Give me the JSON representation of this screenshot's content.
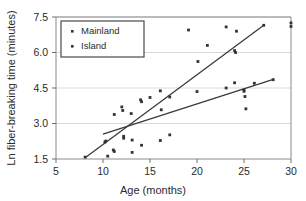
{
  "chart_data": {
    "type": "scatter",
    "title": "",
    "xlabel": "Age (months)",
    "ylabel": "Ln fiber-breaking time (minutes)",
    "xlim": [
      5,
      30
    ],
    "ylim": [
      1.5,
      7.5
    ],
    "xticks": [
      5,
      10,
      15,
      20,
      25,
      30
    ],
    "yticks": [
      1.5,
      3.0,
      4.5,
      6.0,
      7.5
    ],
    "xtick_labels": [
      "5",
      "10",
      "15",
      "20",
      "25",
      "30"
    ],
    "ytick_labels": [
      "1.5",
      "3.0",
      "4.5",
      "6.0",
      "7.5"
    ],
    "grid": "horizontal",
    "legend_position": "top-left",
    "marker_color": "#333333",
    "line_color": "#3a3a3a",
    "series": [
      {
        "name": "Mainland",
        "marker": "square-dot",
        "points": [
          [
            8.1,
            1.58
          ],
          [
            10.2,
            2.22
          ],
          [
            10.3,
            2.26
          ],
          [
            11.2,
            3.38
          ],
          [
            12.0,
            3.7
          ],
          [
            12.1,
            3.55
          ],
          [
            12.2,
            2.46
          ],
          [
            12.2,
            2.38
          ],
          [
            13.0,
            3.42
          ],
          [
            13.1,
            2.3
          ],
          [
            14.0,
            4.0
          ],
          [
            14.1,
            3.92
          ],
          [
            15.0,
            4.1
          ],
          [
            16.1,
            4.38
          ],
          [
            16.2,
            3.58
          ],
          [
            17.1,
            4.12
          ],
          [
            19.1,
            6.95
          ],
          [
            20.0,
            4.35
          ],
          [
            20.1,
            5.62
          ],
          [
            21.1,
            6.3
          ],
          [
            23.1,
            7.08
          ],
          [
            24.0,
            6.08
          ],
          [
            24.1,
            6.0
          ],
          [
            24.2,
            6.9
          ],
          [
            27.1,
            7.15
          ],
          [
            30.0,
            7.25
          ],
          [
            30.0,
            7.1
          ]
        ],
        "trendline": {
          "x1": 8.1,
          "y1": 1.55,
          "x2": 27.1,
          "y2": 7.15
        }
      },
      {
        "name": "Island",
        "marker": "square-dot",
        "points": [
          [
            10.5,
            1.62
          ],
          [
            11.1,
            1.88
          ],
          [
            11.2,
            1.82
          ],
          [
            13.1,
            1.78
          ],
          [
            14.1,
            2.08
          ],
          [
            16.1,
            2.28
          ],
          [
            17.1,
            2.52
          ],
          [
            23.1,
            4.5
          ],
          [
            24.0,
            4.72
          ],
          [
            25.0,
            4.42
          ],
          [
            25.0,
            4.36
          ],
          [
            25.1,
            4.14
          ],
          [
            25.2,
            3.62
          ],
          [
            26.1,
            4.7
          ],
          [
            28.1,
            4.85
          ]
        ],
        "trendline": {
          "x1": 10.0,
          "y1": 2.55,
          "x2": 28.2,
          "y2": 4.88
        }
      }
    ],
    "legend_entries": [
      {
        "label": "Mainland"
      },
      {
        "label": "Island"
      }
    ]
  },
  "axes": {
    "y_axis_title": "Ln fiber-breaking time (minutes)",
    "x_axis_title": "Age (months)"
  },
  "legend": {
    "items": [
      {
        "label": "Mainland"
      },
      {
        "label": "Island"
      }
    ]
  },
  "ticks": {
    "x": [
      "5",
      "10",
      "15",
      "20",
      "25",
      "30"
    ],
    "y": [
      "1.5",
      "3.0",
      "4.5",
      "6.0",
      "7.5"
    ]
  }
}
